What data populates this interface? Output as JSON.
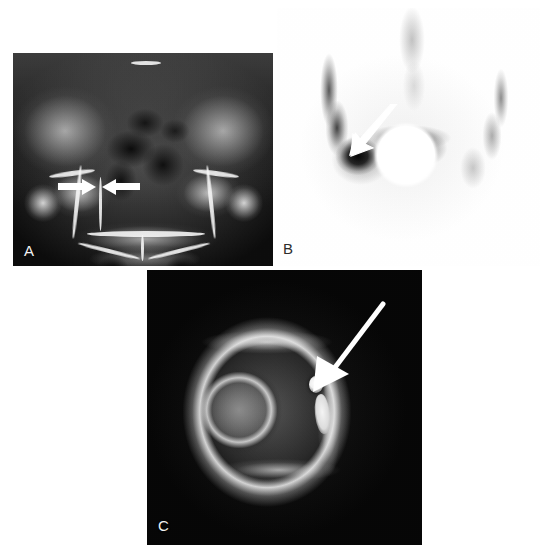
{
  "figure": {
    "background_color": "#ffffff",
    "width": 545,
    "height": 554,
    "layout": "three-panel radiology figure: A top-left, B top-right, C bottom-center"
  },
  "panels": [
    {
      "id": "A",
      "label": "A",
      "label_color": "#f2f2f2",
      "modality": "Radiograph",
      "description": "Anteroposterior pelvic radiograph",
      "findings": "Paired opposing arrows indicate a focal sclerotic cortical lesion along the right superior pubic ramus / acetabular region",
      "annotations": [
        {
          "name": "arrow-left",
          "type": "block-arrow",
          "direction": "right",
          "color": "#ffffff"
        },
        {
          "name": "arrow-right",
          "type": "block-arrow",
          "direction": "left",
          "color": "#ffffff"
        }
      ]
    },
    {
      "id": "B",
      "label": "B",
      "label_color": "#2c2c2c",
      "modality": "Bone scintigraphy",
      "description": "Technetium bone scan of the pelvis, inverted grayscale",
      "findings": "Intense focal radiotracer uptake in the right hemipelvis marked by a single arrow; bladder activity shielded centrally",
      "annotations": [
        {
          "name": "arrow",
          "type": "tapered-arrow",
          "direction": "down-left",
          "color": "#ffffff"
        },
        {
          "name": "bladder-disc",
          "type": "disc",
          "color": "#ffffff"
        }
      ]
    },
    {
      "id": "C",
      "label": "C",
      "label_color": "#f2f2f2",
      "modality": "Computed Tomography",
      "description": "Axial CT image of the hip in bone window",
      "findings": "A long arrow points to a small round lucent nidus with central calcification surrounded by reactive cortical sclerosis",
      "annotations": [
        {
          "name": "arrow",
          "type": "line-arrow",
          "direction": "down-left",
          "color": "#ffffff"
        },
        {
          "name": "nidus",
          "type": "focus",
          "color": "#ffffff"
        }
      ]
    }
  ]
}
